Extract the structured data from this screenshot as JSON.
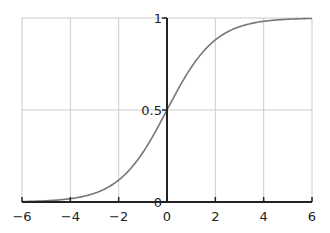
{
  "chart_data": {
    "type": "line",
    "title": "",
    "xlabel": "",
    "ylabel": "",
    "xlim": [
      -6,
      6
    ],
    "ylim": [
      0,
      1
    ],
    "grid": true,
    "legend": null,
    "x_ticks": [
      "−6",
      "−4",
      "−2",
      "0",
      "2",
      "4",
      "6"
    ],
    "x_tick_values": [
      -6,
      -4,
      -2,
      0,
      2,
      4,
      6
    ],
    "y_ticks": [
      "0",
      "0.5",
      "1"
    ],
    "y_tick_values": [
      0,
      0.5,
      1
    ],
    "series": [
      {
        "name": "sigmoid",
        "function": "1/(1+exp(-x))",
        "color": "#777777",
        "x": [
          -6,
          -5,
          -4,
          -3,
          -2,
          -1,
          0,
          1,
          2,
          3,
          4,
          5,
          6
        ],
        "values": [
          0.0025,
          0.0067,
          0.018,
          0.047,
          0.119,
          0.269,
          0.5,
          0.731,
          0.881,
          0.953,
          0.982,
          0.993,
          0.9975
        ]
      }
    ],
    "colors": {
      "axis": "#222222",
      "grid": "#cccccc",
      "curve": "#777777"
    }
  }
}
